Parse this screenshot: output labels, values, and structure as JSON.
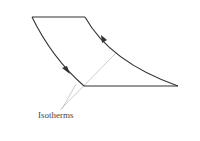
{
  "diagram": {
    "type": "thermodynamic-cycle",
    "label": "Isotherms",
    "colors": {
      "cycle_stroke": "#333333",
      "isotherm_stroke": "#aaaaaa",
      "label_text": "#444444"
    },
    "vertices": {
      "top_left": [
        32,
        17
      ],
      "top_right": [
        85,
        17
      ],
      "bottom_left": [
        84,
        86
      ],
      "bottom_right": [
        178,
        86
      ]
    },
    "arrows": [
      {
        "on": "left-curve",
        "direction": "down",
        "at": [
          67,
          70
        ]
      },
      {
        "on": "right-curve",
        "direction": "up",
        "at": [
          104,
          38
        ]
      }
    ]
  }
}
